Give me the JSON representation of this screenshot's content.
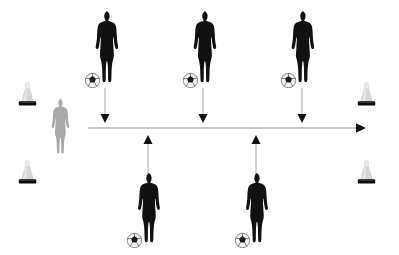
{
  "diagram": {
    "canvas": {
      "width": 399,
      "height": 255,
      "background": "#ffffff"
    },
    "colors": {
      "player_dark": "#111111",
      "player_light": "#a8a8a8",
      "cone_body": "#d8d8d8",
      "cone_base": "#111111",
      "ball_white": "#f2f2f2",
      "ball_mark": "#1a1a1a",
      "arrow_line": "#b4b4b4",
      "arrow_head": "#111111"
    },
    "cones": [
      {
        "id": "cone-top-left",
        "label": "Cone",
        "x": 12,
        "y": 78,
        "w": 31,
        "h": 31
      },
      {
        "id": "cone-bottom-left",
        "label": "Cone",
        "x": 12,
        "y": 156,
        "w": 31,
        "h": 31
      },
      {
        "id": "cone-top-right",
        "label": "Cone",
        "x": 351,
        "y": 78,
        "w": 31,
        "h": 31
      },
      {
        "id": "cone-bottom-right",
        "label": "Cone",
        "x": 351,
        "y": 156,
        "w": 31,
        "h": 31
      }
    ],
    "players": [
      {
        "id": "player-start-gray",
        "role": "Starting player",
        "color": "light",
        "has_ball": false,
        "ball_side": "none",
        "x": 46,
        "y": 98,
        "w": 32,
        "h": 60
      },
      {
        "id": "player-top-1",
        "role": "Feeder player 1",
        "color": "dark",
        "has_ball": true,
        "ball_side": "right",
        "x": 92,
        "y": 10,
        "w": 32,
        "h": 78
      },
      {
        "id": "player-top-2",
        "role": "Feeder player 2",
        "color": "dark",
        "has_ball": true,
        "ball_side": "left",
        "x": 190,
        "y": 10,
        "w": 32,
        "h": 78
      },
      {
        "id": "player-top-3",
        "role": "Feeder player 3",
        "color": "dark",
        "has_ball": true,
        "ball_side": "left",
        "x": 288,
        "y": 10,
        "w": 32,
        "h": 78
      },
      {
        "id": "player-bottom-1",
        "role": "Feeder player 4",
        "color": "dark",
        "has_ball": true,
        "ball_side": "left",
        "x": 134,
        "y": 172,
        "w": 32,
        "h": 76
      },
      {
        "id": "player-bottom-2",
        "role": "Feeder player 5",
        "color": "dark",
        "has_ball": true,
        "ball_side": "left",
        "x": 242,
        "y": 172,
        "w": 32,
        "h": 76
      }
    ],
    "arrows": [
      {
        "id": "arrow-run-path",
        "label": "Run path",
        "direction": "right",
        "x1": 88,
        "y1": 128,
        "x2": 365,
        "y2": 128
      },
      {
        "id": "arrow-pass-down-1",
        "label": "Pass down 1",
        "direction": "down",
        "x1": 105,
        "y1": 88,
        "x2": 105,
        "y2": 123
      },
      {
        "id": "arrow-pass-down-2",
        "label": "Pass down 2",
        "direction": "down",
        "x1": 203,
        "y1": 88,
        "x2": 203,
        "y2": 123
      },
      {
        "id": "arrow-pass-down-3",
        "label": "Pass down 3",
        "direction": "down",
        "x1": 302,
        "y1": 88,
        "x2": 302,
        "y2": 123
      },
      {
        "id": "arrow-pass-up-1",
        "label": "Pass up 1",
        "direction": "up",
        "x1": 148,
        "y1": 172,
        "x2": 148,
        "y2": 134
      },
      {
        "id": "arrow-pass-up-2",
        "label": "Pass up 2",
        "direction": "up",
        "x1": 256,
        "y1": 172,
        "x2": 256,
        "y2": 134
      }
    ]
  }
}
